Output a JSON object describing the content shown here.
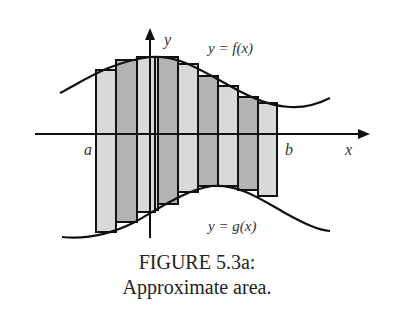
{
  "figure": {
    "caption_line1": "FIGURE 5.3a:",
    "caption_line2": "Approximate area.",
    "labels": {
      "y_axis": "y",
      "x_axis": "x",
      "a": "a",
      "b": "b",
      "f_curve": "y = f(x)",
      "g_curve": "y = g(x)"
    },
    "colors": {
      "light_fill": "#d9d9d9",
      "dark_fill": "#b3b3b3",
      "stroke": "#111111",
      "background": "#ffffff"
    },
    "rectangles": [
      {
        "x0": 96,
        "x1": 116,
        "top": 70,
        "bottom": 232,
        "shade": "light"
      },
      {
        "x0": 116,
        "x1": 137,
        "top": 60,
        "bottom": 222,
        "shade": "dark"
      },
      {
        "x0": 137,
        "x1": 155,
        "top": 57,
        "bottom": 212,
        "shade": "light"
      },
      {
        "x0": 155,
        "x1": 158,
        "top": 57,
        "bottom": 210,
        "shade": "light"
      },
      {
        "x0": 158,
        "x1": 178,
        "top": 57,
        "bottom": 204,
        "shade": "dark"
      },
      {
        "x0": 178,
        "x1": 198,
        "top": 64,
        "bottom": 192,
        "shade": "light"
      },
      {
        "x0": 198,
        "x1": 218,
        "top": 76,
        "bottom": 186,
        "shade": "dark"
      },
      {
        "x0": 218,
        "x1": 238,
        "top": 86,
        "bottom": 186,
        "shade": "light"
      },
      {
        "x0": 238,
        "x1": 258,
        "top": 97,
        "bottom": 190,
        "shade": "dark"
      },
      {
        "x0": 258,
        "x1": 277,
        "top": 103,
        "bottom": 196,
        "shade": "light"
      }
    ]
  }
}
